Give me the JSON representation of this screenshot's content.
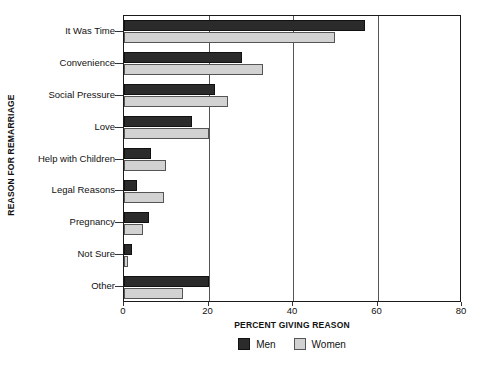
{
  "chart_data": {
    "type": "bar",
    "orientation": "horizontal",
    "title": "",
    "xlabel": "PERCENT GIVING REASON",
    "ylabel": "REASON FOR REMARRIAGE",
    "xlim": [
      0,
      80
    ],
    "xticks": [
      0,
      20,
      40,
      60,
      80
    ],
    "xtick_labels": [
      "0",
      "20",
      "40",
      "60",
      "80"
    ],
    "grid": true,
    "grid_axis": "x",
    "legend_position": "bottom",
    "categories": [
      "It Was Time",
      "Convenience",
      "Social Pressure",
      "Love",
      "Help with Children",
      "Legal Reasons",
      "Pregnancy",
      "Not Sure",
      "Other"
    ],
    "series": [
      {
        "name": "Men",
        "color": "#2b2b2b",
        "values": [
          57,
          28,
          21.5,
          16,
          6.5,
          3,
          6,
          2,
          20
        ]
      },
      {
        "name": "Women",
        "color": "#d2d2d2",
        "values": [
          50,
          33,
          24.5,
          20,
          10,
          9.5,
          4.5,
          1,
          14
        ]
      }
    ]
  },
  "legend": {
    "entries": [
      {
        "label": "Men",
        "swatch": "men-swatch"
      },
      {
        "label": "Women",
        "swatch": "women-swatch"
      }
    ]
  }
}
